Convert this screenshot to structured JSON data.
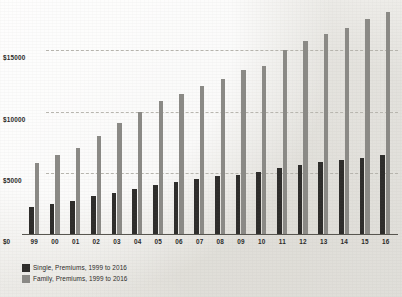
{
  "chart_data": {
    "type": "bar",
    "title": "",
    "subtitle": "",
    "xlabel": "",
    "ylabel": "",
    "categories": [
      "99",
      "00",
      "01",
      "02",
      "03",
      "04",
      "05",
      "06",
      "07",
      "08",
      "09",
      "10",
      "11",
      "12",
      "13",
      "14",
      "15",
      "16"
    ],
    "series": [
      {
        "name": "Single, Premiums, 1999 to 2016",
        "color": "#2e2d2b",
        "values": [
          2196,
          2471,
          2689,
          3083,
          3383,
          3695,
          4024,
          4242,
          4479,
          4704,
          4824,
          5049,
          5429,
          5615,
          5884,
          6025,
          6251,
          6435
        ]
      },
      {
        "name": "Family, Premiums, 1999 to 2016",
        "color": "#8b8a86",
        "values": [
          5791,
          6438,
          7061,
          8003,
          9068,
          9950,
          10880,
          11480,
          12106,
          12680,
          13375,
          13770,
          15073,
          15745,
          16351,
          16834,
          17545,
          18142
        ]
      }
    ],
    "ylim": [
      0,
      18800
    ],
    "yticks": [
      0,
      5000,
      10000,
      15000
    ],
    "ytick_labels": [
      "$0",
      "$5000",
      "$10000",
      "$15000"
    ],
    "grid": true,
    "grid_style": "dashed",
    "legend_position": "bottom-left"
  },
  "legend": {
    "items": [
      {
        "label": "Single, Premiums, 1999 to 2016"
      },
      {
        "label": "Family, Premiums, 1999 to 2016"
      }
    ]
  },
  "axis": {
    "zero_label": "$0"
  }
}
